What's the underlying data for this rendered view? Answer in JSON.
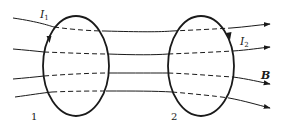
{
  "diagram": {
    "type": "physics-magnetic-field-through-two-current-loops",
    "labels": {
      "current1_main": "I",
      "current1_sub": "1",
      "current2_main": "I",
      "current2_sub": "2",
      "field": "B",
      "loop1": "1",
      "loop2": "2"
    },
    "loops": [
      {
        "id": "1",
        "cx": 76,
        "cy": 66,
        "rx": 33,
        "ry": 50
      },
      {
        "id": "2",
        "cx": 201,
        "cy": 66,
        "rx": 33,
        "ry": 50
      }
    ],
    "field_lines_count": 4,
    "colors": {
      "stroke": "#1a1a1a",
      "background": "#ffffff"
    }
  }
}
